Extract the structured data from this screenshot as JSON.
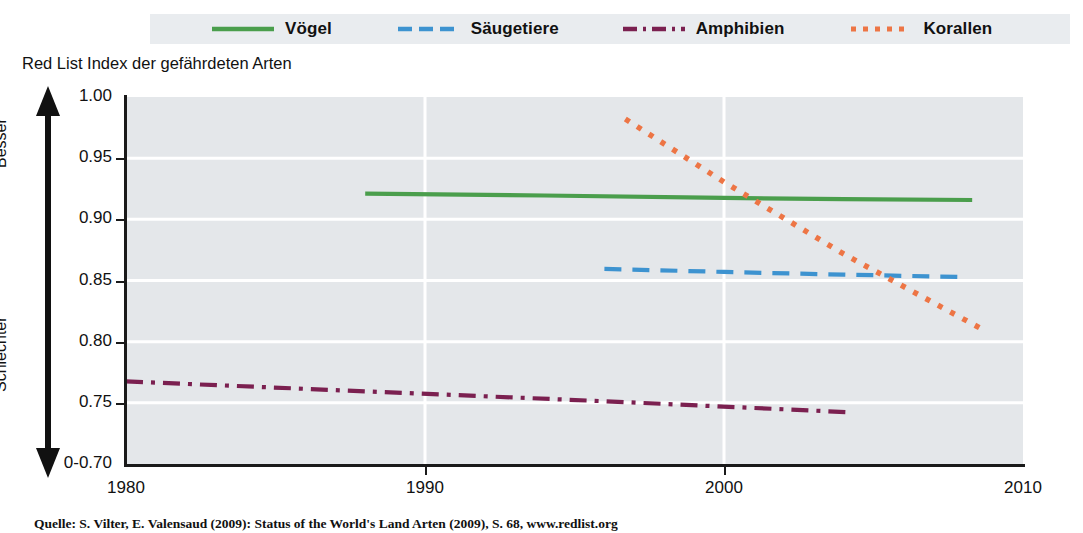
{
  "chart_data": {
    "type": "line",
    "title": "Red List Index der gefährdeten Arten",
    "xlabel": "",
    "ylabel": "Red List Index",
    "xlim": [
      1980,
      2010
    ],
    "ylim": [
      0.7,
      1.0
    ],
    "grid": true,
    "legend_position": "top",
    "xticks": [
      "1980",
      "1990",
      "2000",
      "2010"
    ],
    "xtick_values": [
      1980,
      1990,
      2000,
      2010
    ],
    "yticks": [
      "1.00",
      "0.95",
      "0.90",
      "0.85",
      "0.80",
      "0.75",
      "0-0.70"
    ],
    "ytick_values": [
      1.0,
      0.95,
      0.9,
      0.85,
      0.8,
      0.75,
      0.7
    ],
    "axis_break_note": "0-0.70",
    "direction_labels": {
      "top": "Besser",
      "bottom": "Schlechter"
    },
    "series": [
      {
        "name": "Vögel",
        "color": "#4a9e4c",
        "style": "solid",
        "x": [
          1988,
          1994,
          2000,
          2004,
          2008.3
        ],
        "values": [
          0.921,
          0.9195,
          0.9175,
          0.9165,
          0.9158
        ]
      },
      {
        "name": "Säugetiere",
        "color": "#3d93d0",
        "style": "dashed",
        "x": [
          1996,
          2000,
          2004,
          2008.1
        ],
        "values": [
          0.8595,
          0.857,
          0.8548,
          0.8528
        ]
      },
      {
        "name": "Amphibien",
        "color": "#7b2050",
        "style": "dashdot",
        "x": [
          1980,
          1988,
          1996,
          2004.3
        ],
        "values": [
          0.7675,
          0.7594,
          0.7513,
          0.7422
        ]
      },
      {
        "name": "Korallen",
        "color": "#ed7545",
        "style": "dotted",
        "x": [
          1996.7,
          2000,
          2004,
          2008.8
        ],
        "values": [
          0.982,
          0.9305,
          0.8717,
          0.808
        ]
      }
    ]
  },
  "caption": "Quelle: S. Vilter, E. Valensaud (2009): Status of the World's Land Arten (2009), S. 68, www.redlist.org"
}
